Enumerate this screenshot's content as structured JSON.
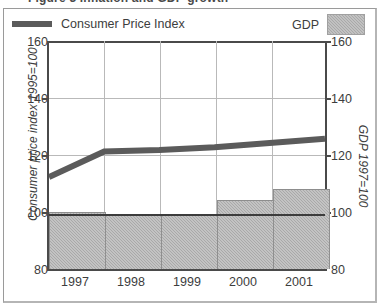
{
  "title": "Figure 3  Inflation and GDP growth",
  "legend": {
    "cpi_label": "Consumer Price Index",
    "gdp_label": "GDP",
    "cpi_color": "#5b5b5b",
    "gdp_color": "#a9a9a9"
  },
  "axes": {
    "y_left_title": "Consumer price index 1995=100",
    "y_right_title": "GDP 1997=100",
    "y_ticks": [
      "160",
      "140",
      "120",
      "100",
      "80"
    ],
    "x_ticks": [
      "1997",
      "1998",
      "1999",
      "2000",
      "2001"
    ]
  },
  "chart_data": {
    "type": "bar",
    "title": "Figure 3  Inflation and GDP growth",
    "categories": [
      "1997",
      "1998",
      "1999",
      "2000",
      "2001"
    ],
    "xlabel": "",
    "ylabel": "Consumer price index 1995=100",
    "ylabel_secondary": "GDP 1997=100",
    "ylim": [
      80,
      160
    ],
    "ylim_secondary": [
      80,
      160
    ],
    "grid": true,
    "legend_position": "top",
    "series": [
      {
        "name": "GDP",
        "type": "bar",
        "axis": "right",
        "color": "#a9a9a9",
        "values": [
          100,
          99,
          99,
          104,
          108
        ]
      },
      {
        "name": "Consumer Price Index",
        "type": "line",
        "axis": "left",
        "color": "#5b5b5b",
        "values": [
          112,
          121,
          121.5,
          122.5,
          125.5
        ]
      }
    ]
  }
}
